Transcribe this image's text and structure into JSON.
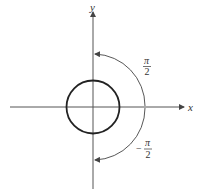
{
  "diagram": {
    "axes": {
      "x_label": "x",
      "y_label": "y",
      "color": "#555555"
    },
    "circle": {
      "center": [
        93,
        107
      ],
      "radius": 26.5,
      "color": "#222222"
    },
    "arc": {
      "center": [
        93,
        107
      ],
      "radius": 53,
      "color": "#444444",
      "top_label": {
        "numerator": "π",
        "denominator": "2"
      },
      "bottom_label": {
        "sign": "−",
        "numerator": "π",
        "denominator": "2"
      }
    }
  }
}
